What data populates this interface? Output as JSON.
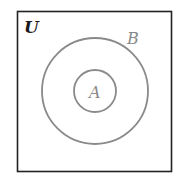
{
  "diagram": {
    "type": "venn",
    "universe": {
      "label": "U",
      "color": "#1a1a1a"
    },
    "sets": [
      {
        "label": "B",
        "color": "#8a8a8a"
      },
      {
        "label": "A",
        "color": "#8a8a8a"
      }
    ],
    "relation": "A is a subset of B"
  }
}
